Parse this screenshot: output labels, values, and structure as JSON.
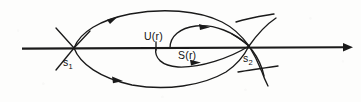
{
  "figure": {
    "background_color": "#fdfdfc",
    "stroke_color": "#1a1a1a",
    "width": 361,
    "height": 102
  },
  "labels": {
    "saddle_left": {
      "base": "s",
      "subscript": "1",
      "x": 63,
      "y": 66
    },
    "saddle_right": {
      "base": "s",
      "subscript": "2",
      "x": 243,
      "y": 62
    },
    "unstable_manifold": {
      "text": "U(r)",
      "x": 144,
      "y": 40
    },
    "stable_manifold": {
      "text": "S(r)",
      "x": 178,
      "y": 59
    }
  },
  "axis": {
    "name": "horizontal-axis",
    "x_start": 22,
    "x_end": 348,
    "y": 48,
    "arrow_at": "right"
  },
  "arrows": [
    {
      "name": "upper-outer-arc-arrow",
      "x": 113,
      "y": 17,
      "direction": "right"
    },
    {
      "name": "lower-outer-arc-arrow",
      "x": 118,
      "y": 80,
      "direction": "right"
    },
    {
      "name": "upper-lens-arrow",
      "x": 205,
      "y": 27,
      "direction": "right"
    },
    {
      "name": "lower-lens-arrow",
      "x": 196,
      "y": 62,
      "direction": "right"
    },
    {
      "name": "axis-end-arrow",
      "x": 348,
      "y": 48,
      "direction": "right"
    }
  ],
  "nodes": [
    {
      "name": "saddle-point-1",
      "x": 74,
      "y": 48
    },
    {
      "name": "saddle-point-2",
      "x": 249,
      "y": 46
    }
  ]
}
